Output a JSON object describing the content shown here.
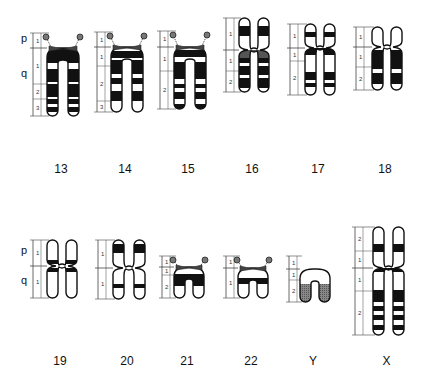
{
  "diagram": {
    "type": "chromosome-ideogram",
    "arm_labels": {
      "p": "p",
      "q": "q"
    },
    "rows": [
      {
        "chromosomes": [
          {
            "id": "13",
            "label": "13",
            "type": "acrocentric",
            "satellite": true,
            "x": 33,
            "top": 33,
            "cen": 48,
            "bottom": 116,
            "width": 11,
            "gap": 10,
            "lx": 47,
            "p_regions": [
              "1"
            ],
            "q_regions": [
              "1",
              "2",
              "3"
            ],
            "q_region_bounds": [
              48,
              84,
              99,
              116
            ],
            "bands": [
              [
                48,
                63,
                "k"
              ],
              [
                63,
                69,
                "w"
              ],
              [
                69,
                82,
                "k"
              ],
              [
                82,
                84,
                "w"
              ],
              [
                84,
                97,
                "k"
              ],
              [
                97,
                99,
                "w"
              ],
              [
                99,
                104,
                "k"
              ],
              [
                104,
                107,
                "w"
              ],
              [
                107,
                112,
                "k"
              ],
              [
                112,
                116,
                "w"
              ]
            ]
          },
          {
            "id": "14",
            "label": "14",
            "type": "acrocentric",
            "satellite": true,
            "x": 97,
            "top": 32,
            "cen": 47,
            "bottom": 112,
            "width": 11,
            "gap": 10,
            "lx": 111,
            "p_regions": [
              "1"
            ],
            "q_regions": [
              "1",
              "2",
              "3"
            ],
            "q_region_bounds": [
              47,
              66,
              101,
              112
            ],
            "bands": [
              [
                47,
                51,
                "w"
              ],
              [
                51,
                58,
                "k"
              ],
              [
                58,
                60,
                "w"
              ],
              [
                60,
                74,
                "k"
              ],
              [
                74,
                78,
                "w"
              ],
              [
                78,
                84,
                "k"
              ],
              [
                84,
                91,
                "w"
              ],
              [
                91,
                101,
                "k"
              ],
              [
                101,
                112,
                "w"
              ]
            ]
          },
          {
            "id": "15",
            "label": "15",
            "type": "acrocentric",
            "satellite": true,
            "x": 160,
            "top": 31,
            "cen": 47,
            "bottom": 109,
            "width": 11,
            "gap": 10,
            "lx": 174,
            "p_regions": [
              "1"
            ],
            "q_regions": [
              "1",
              "2"
            ],
            "q_region_bounds": [
              47,
              71,
              109
            ],
            "bands": [
              [
                47,
                50,
                "w"
              ],
              [
                50,
                57,
                "k"
              ],
              [
                57,
                62,
                "w"
              ],
              [
                62,
                79,
                "k"
              ],
              [
                79,
                84,
                "w"
              ],
              [
                84,
                88,
                "k"
              ],
              [
                88,
                92,
                "w"
              ],
              [
                92,
                99,
                "k"
              ],
              [
                99,
                104,
                "w"
              ],
              [
                104,
                109,
                "k"
              ]
            ]
          },
          {
            "id": "16",
            "label": "16",
            "type": "metacentric",
            "satellite": false,
            "x": 226,
            "top": 18,
            "cen": 50,
            "bottom": 92,
            "width": 11,
            "gap": 8,
            "lx": 239,
            "p_regions": [
              "1"
            ],
            "q_regions": [
              "1",
              "2"
            ],
            "q_region_bounds": [
              50,
              71,
              92
            ],
            "bands": [
              [
                18,
                26,
                "w"
              ],
              [
                26,
                36,
                "k"
              ],
              [
                36,
                50,
                "w"
              ],
              [
                50,
                58,
                "g"
              ],
              [
                58,
                63,
                "k"
              ],
              [
                63,
                66,
                "w"
              ],
              [
                66,
                75,
                "k"
              ],
              [
                75,
                78,
                "w"
              ],
              [
                78,
                88,
                "k"
              ],
              [
                88,
                92,
                "w"
              ]
            ]
          },
          {
            "id": "17",
            "label": "17",
            "type": "submetacentric",
            "satellite": false,
            "x": 290,
            "top": 24,
            "cen": 48,
            "bottom": 95,
            "width": 11,
            "gap": 8,
            "lx": 305,
            "p_regions": [
              "1"
            ],
            "q_regions": [
              "1",
              "2"
            ],
            "q_region_bounds": [
              48,
              61,
              95
            ],
            "bands": [
              [
                24,
                32,
                "w"
              ],
              [
                32,
                37,
                "k"
              ],
              [
                37,
                48,
                "w"
              ],
              [
                48,
                55,
                "k"
              ],
              [
                55,
                72,
                "w"
              ],
              [
                72,
                80,
                "k"
              ],
              [
                80,
                83,
                "w"
              ],
              [
                83,
                87,
                "k"
              ],
              [
                87,
                95,
                "w"
              ]
            ]
          },
          {
            "id": "18",
            "label": "18",
            "type": "submetacentric",
            "satellite": false,
            "x": 356,
            "top": 27,
            "cen": 47,
            "bottom": 90,
            "width": 11,
            "gap": 8,
            "lx": 372,
            "p_regions": [
              "1"
            ],
            "q_regions": [
              "1",
              "2"
            ],
            "q_region_bounds": [
              47,
              67,
              90
            ],
            "bands": [
              [
                27,
                47,
                "w"
              ],
              [
                47,
                50,
                "w"
              ],
              [
                50,
                69,
                "k"
              ],
              [
                69,
                73,
                "w"
              ],
              [
                73,
                84,
                "k"
              ],
              [
                84,
                90,
                "w"
              ]
            ]
          }
        ]
      },
      {
        "chromosomes": [
          {
            "id": "19",
            "label": "19",
            "type": "metacentric",
            "satellite": false,
            "x": 33,
            "top": 240,
            "cen": 266,
            "bottom": 298,
            "width": 11,
            "gap": 8,
            "lx": 47,
            "p_regions": [
              "1"
            ],
            "q_regions": [
              "1"
            ],
            "q_region_bounds": [
              266,
              298
            ],
            "bands": [
              [
                240,
                260,
                "w"
              ],
              [
                260,
                264,
                "k"
              ],
              [
                264,
                268,
                "w"
              ],
              [
                268,
                272,
                "k"
              ],
              [
                272,
                298,
                "w"
              ]
            ]
          },
          {
            "id": "20",
            "label": "20",
            "type": "metacentric",
            "satellite": false,
            "x": 98,
            "top": 240,
            "cen": 268,
            "bottom": 299,
            "width": 11,
            "gap": 10,
            "lx": 113,
            "p_regions": [
              "1"
            ],
            "q_regions": [
              "1"
            ],
            "q_region_bounds": [
              268,
              299
            ],
            "bands": [
              [
                240,
                244,
                "w"
              ],
              [
                244,
                253,
                "k"
              ],
              [
                253,
                284,
                "w"
              ],
              [
                284,
                288,
                "k"
              ],
              [
                288,
                299,
                "w"
              ]
            ]
          },
          {
            "id": "21",
            "label": "21",
            "type": "acrocentric",
            "satellite": true,
            "x": 162,
            "top": 256,
            "cen": 267,
            "bottom": 298,
            "width": 11,
            "gap": 8,
            "lx": 174,
            "p_regions": [
              "1"
            ],
            "q_regions": [
              "1",
              "2"
            ],
            "q_region_bounds": [
              267,
              275,
              298
            ],
            "bands": [
              [
                267,
                274,
                "w"
              ],
              [
                274,
                286,
                "k"
              ],
              [
                286,
                298,
                "w"
              ]
            ]
          },
          {
            "id": "22",
            "label": "22",
            "type": "acrocentric",
            "satellite": true,
            "x": 226,
            "top": 256,
            "cen": 268,
            "bottom": 298,
            "width": 11,
            "gap": 8,
            "lx": 238,
            "p_regions": [
              "1"
            ],
            "q_regions": [
              "1"
            ],
            "q_region_bounds": [
              268,
              298
            ],
            "bands": [
              [
                268,
                278,
                "w"
              ],
              [
                278,
                284,
                "k"
              ],
              [
                284,
                298,
                "w"
              ]
            ]
          },
          {
            "id": "Y",
            "label": "Y",
            "type": "acrocentric",
            "satellite": false,
            "x": 289,
            "top": 256,
            "cen": 269,
            "bottom": 302,
            "width": 11,
            "gap": 8,
            "lx": 300,
            "p_regions": [
              "1"
            ],
            "q_regions": [
              "1",
              "2"
            ],
            "q_region_bounds": [
              269,
              280,
              302
            ],
            "bands": [
              [
                269,
                284,
                "w"
              ],
              [
                284,
                302,
                "h"
              ]
            ]
          },
          {
            "id": "X",
            "label": "X",
            "type": "submetacentric",
            "satellite": false,
            "x": 355,
            "top": 227,
            "cen": 268,
            "bottom": 335,
            "width": 11,
            "gap": 9,
            "lx": 373,
            "p_regions": [
              "2",
              "1"
            ],
            "q_regions": [
              "1",
              "2"
            ],
            "q_region_bounds": [
              268,
              291,
              335
            ],
            "p_region_bounds": [
              227,
              251,
              268
            ],
            "bands": [
              [
                227,
                244,
                "w"
              ],
              [
                244,
                252,
                "k"
              ],
              [
                252,
                268,
                "w"
              ],
              [
                268,
                272,
                "k"
              ],
              [
                272,
                290,
                "w"
              ],
              [
                290,
                302,
                "k"
              ],
              [
                302,
                306,
                "w"
              ],
              [
                306,
                311,
                "k"
              ],
              [
                311,
                315,
                "w"
              ],
              [
                315,
                320,
                "k"
              ],
              [
                320,
                325,
                "w"
              ],
              [
                325,
                330,
                "k"
              ],
              [
                330,
                335,
                "w"
              ]
            ]
          }
        ]
      }
    ],
    "labels_row1_y": 170,
    "labels_row2_y": 362,
    "row_arm_labels": [
      {
        "p_y": 41,
        "q_y": 74,
        "x": 24
      },
      {
        "p_y": 253,
        "q_y": 281,
        "x": 24
      }
    ],
    "colors": {
      "band_dark": "#111111",
      "band_gray": "#555555",
      "outline": "#111111",
      "background": "#ffffff",
      "ruler": "#444444"
    }
  }
}
